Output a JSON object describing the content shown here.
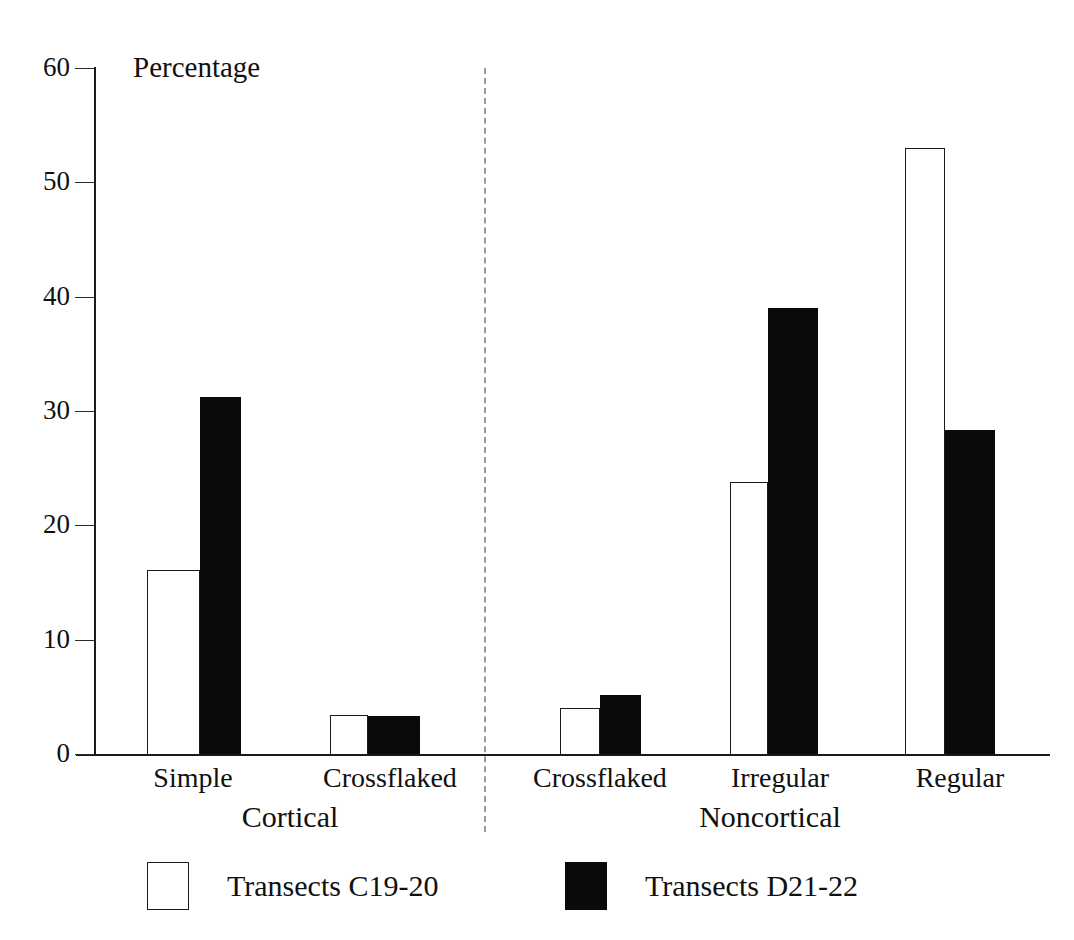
{
  "chart_data": {
    "type": "bar",
    "title": "",
    "xlabel": "",
    "ylabel": "Percentage",
    "ylim": [
      0,
      60
    ],
    "yticks": [
      0,
      10,
      20,
      30,
      40,
      50,
      60
    ],
    "ytick_labels": [
      "0",
      "10",
      "20",
      "30",
      "40",
      "50",
      "60"
    ],
    "grid": false,
    "legend_position": "bottom",
    "group_labels": [
      "Cortical",
      "Noncortical"
    ],
    "groups": [
      {
        "name": "Cortical",
        "categories": [
          "Simple",
          "Crossflaked"
        ]
      },
      {
        "name": "Noncortical",
        "categories": [
          "Crossflaked",
          "Irregular",
          "Regular"
        ]
      }
    ],
    "categories": [
      "Simple",
      "Crossflaked",
      "Crossflaked",
      "Irregular",
      "Regular"
    ],
    "series": [
      {
        "name": "Transects C19-20",
        "style": "open",
        "color": "#ffffff",
        "values": [
          16.1,
          3.4,
          4.0,
          23.8,
          53.0
        ]
      },
      {
        "name": "Transects D21-22",
        "style": "filled",
        "color": "#0a0a0a",
        "values": [
          31.2,
          3.3,
          5.2,
          39.0,
          28.3
        ]
      }
    ],
    "divider": {
      "style": "dashed",
      "between": [
        "Cortical",
        "Noncortical"
      ]
    }
  },
  "axis": {
    "y_title": "Percentage",
    "ticks": [
      {
        "label": "60",
        "value": 60
      },
      {
        "label": "50",
        "value": 50
      },
      {
        "label": "40",
        "value": 40
      },
      {
        "label": "30",
        "value": 30
      },
      {
        "label": "20",
        "value": 20
      },
      {
        "label": "10",
        "value": 10
      },
      {
        "label": "0",
        "value": 0
      }
    ]
  },
  "categories": {
    "c0": "Simple",
    "c1": "Crossflaked",
    "c2": "Crossflaked",
    "c3": "Irregular",
    "c4": "Regular"
  },
  "groups": {
    "left": "Cortical",
    "right": "Noncortical"
  },
  "legend": {
    "entries": [
      {
        "label": "Transects C19-20",
        "style": "open"
      },
      {
        "label": "Transects D21-22",
        "style": "filled"
      }
    ],
    "entry0": "Transects C19-20",
    "entry1": "Transects D21-22"
  }
}
